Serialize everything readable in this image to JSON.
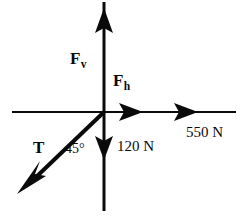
{
  "diagram": {
    "background_color": "#ffffff",
    "stroke_color": "#0a0a0a",
    "origin": {
      "x": 104,
      "y": 112
    },
    "labels": {
      "f_vertical": {
        "symbol": "F",
        "subscript": "v",
        "name": "vertical force"
      },
      "f_horizontal": {
        "symbol": "F",
        "subscript": "h",
        "name": "horizontal force"
      },
      "tension": {
        "symbol": "T",
        "name": "tension force"
      },
      "angle": {
        "text": "45°",
        "value": 45,
        "unit": "degrees"
      },
      "horizontal_magnitude": {
        "text": "550 N",
        "value": 550,
        "unit": "N"
      },
      "vertical_magnitude": {
        "text": "120 N",
        "value": 120,
        "unit": "N"
      }
    },
    "vectors": [
      {
        "name": "f-vertical-up",
        "direction": "up",
        "label": "F_v",
        "magnitude": ""
      },
      {
        "name": "f-horizontal-right",
        "direction": "right",
        "label": "F_h",
        "magnitude": ""
      },
      {
        "name": "weight-down",
        "direction": "down",
        "label": "",
        "magnitude": "120 N"
      },
      {
        "name": "applied-right",
        "direction": "right",
        "label": "",
        "magnitude": "550 N"
      },
      {
        "name": "tension-down-left",
        "direction": "down-left",
        "label": "T",
        "magnitude": "",
        "angle": "45°"
      }
    ]
  }
}
